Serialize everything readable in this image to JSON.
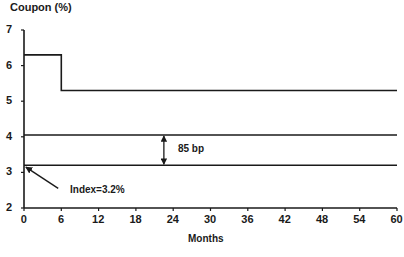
{
  "chart_data": {
    "type": "line",
    "title": "Coupon (%)",
    "xlabel": "Months",
    "ylabel": "Coupon (%)",
    "xlim": [
      0,
      60
    ],
    "ylim": [
      2,
      7
    ],
    "x_ticks": [
      0,
      6,
      12,
      18,
      24,
      30,
      36,
      42,
      48,
      54,
      60
    ],
    "y_ticks": [
      2,
      3,
      4,
      5,
      6,
      7
    ],
    "grid": false,
    "legend": null,
    "series": [
      {
        "name": "Coupon (step)",
        "x": [
          0,
          6,
          6,
          60
        ],
        "y": [
          6.3,
          6.3,
          5.3,
          5.3
        ]
      },
      {
        "name": "Index + 85 bp",
        "x": [
          0,
          60
        ],
        "y": [
          4.05,
          4.05
        ]
      },
      {
        "name": "Index",
        "x": [
          0,
          60
        ],
        "y": [
          3.2,
          3.2
        ]
      }
    ],
    "annotations": [
      {
        "text": "85 bp",
        "type": "double-arrow",
        "x": 22.5,
        "y_from": 3.2,
        "y_to": 4.05
      },
      {
        "text": "Index=3.2%",
        "type": "arrow",
        "from": [
          5.5,
          2.55
        ],
        "to": [
          0.3,
          3.15
        ]
      }
    ],
    "colors": {
      "line": "#1a1a1a",
      "background": "#ffffff"
    }
  }
}
